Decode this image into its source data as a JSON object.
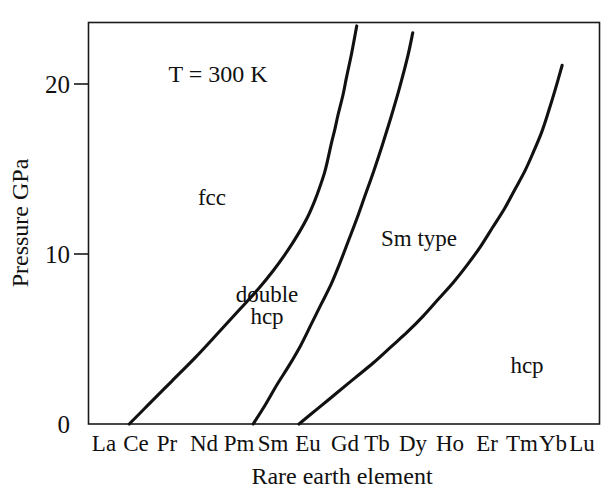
{
  "chart_data": {
    "type": "line",
    "title": "",
    "subtitle": "",
    "xlabel": "Rare earth element",
    "ylabel": "Pressure  GPa",
    "annotation": "T = 300 K",
    "grid": false,
    "legend_position": "none",
    "ylim": [
      0,
      23.5
    ],
    "yticks": [
      0,
      10,
      20
    ],
    "ytick_labels": [
      "0",
      "10",
      "20"
    ],
    "categories": [
      "La",
      "Ce",
      "Pr",
      "Nd",
      "Pm",
      "Sm",
      "Eu",
      "Gd",
      "Tb",
      "Dy",
      "Ho",
      "Er",
      "Tm",
      "Yb",
      "Lu"
    ],
    "x_index": [
      1,
      2,
      3,
      4,
      5,
      6,
      7,
      8,
      9,
      10,
      11,
      12,
      13,
      14,
      15
    ],
    "xlim": [
      0.55,
      15.6
    ],
    "series": [
      {
        "name": "fcc / double hcp boundary",
        "x": [
          1.75,
          2.3,
          3.0,
          3.7,
          4.4,
          5.0,
          5.55,
          6.0,
          6.4,
          6.75,
          7.0,
          7.2,
          7.35,
          7.5,
          7.6,
          7.7,
          7.8,
          7.9,
          8.05,
          8.15,
          8.3,
          8.45
        ],
        "y": [
          0.0,
          1.1,
          2.5,
          3.9,
          5.4,
          6.7,
          7.9,
          9.0,
          10.1,
          11.2,
          12.1,
          13.0,
          13.8,
          14.7,
          15.5,
          16.4,
          17.2,
          18.1,
          19.3,
          20.3,
          21.7,
          23.3
        ]
      },
      {
        "name": "double hcp / Sm type boundary",
        "x": [
          5.4,
          5.75,
          6.1,
          6.45,
          6.8,
          7.1,
          7.4,
          7.7,
          7.95,
          8.2,
          8.45,
          8.7,
          8.95,
          9.2,
          9.45,
          9.7,
          9.95,
          10.1
        ],
        "y": [
          0.0,
          1.1,
          2.3,
          3.4,
          4.6,
          5.8,
          7.0,
          8.2,
          9.4,
          10.7,
          12.0,
          13.4,
          14.8,
          16.3,
          17.9,
          19.6,
          21.5,
          22.9
        ]
      },
      {
        "name": "Sm type / hcp boundary",
        "x": [
          6.75,
          7.3,
          7.85,
          8.4,
          8.95,
          9.45,
          9.95,
          10.4,
          10.85,
          11.3,
          11.7,
          12.1,
          12.45,
          12.8,
          13.1,
          13.4,
          13.65,
          13.9,
          14.1,
          14.3,
          14.5
        ],
        "y": [
          0.0,
          0.9,
          1.8,
          2.7,
          3.6,
          4.5,
          5.4,
          6.3,
          7.3,
          8.3,
          9.3,
          10.4,
          11.5,
          12.6,
          13.7,
          14.8,
          15.9,
          17.1,
          18.3,
          19.6,
          21.0
        ]
      }
    ],
    "region_labels": [
      {
        "text": "fcc",
        "x": 3.35,
        "y": 14.0
      },
      {
        "text": "double",
        "x": 6.05,
        "y": 8.1
      },
      {
        "text": "hcp",
        "x": 6.05,
        "y": 6.8
      },
      {
        "text": "Sm type",
        "x": 10.1,
        "y": 10.6
      },
      {
        "text": "hcp",
        "x": 13.3,
        "y": 3.6
      }
    ]
  },
  "figure": {
    "annotation_text": "T = 300 K",
    "x_axis_title": "Rare earth element",
    "y_axis_title": "Pressure  GPa",
    "tick_0": "0",
    "tick_10": "10",
    "tick_20": "20",
    "label_la": "La",
    "label_ce": "Ce",
    "label_pr": "Pr",
    "label_nd": "Nd",
    "label_pm": "Pm",
    "label_sm": "Sm",
    "label_eu": "Eu",
    "label_gd": "Gd",
    "label_tb": "Tb",
    "label_dy": "Dy",
    "label_ho": "Ho",
    "label_er": "Er",
    "label_tm": "Tm",
    "label_yb": "Yb",
    "label_lu": "Lu",
    "region_fcc": "fcc",
    "region_double": "double",
    "region_double_hcp": "hcp",
    "region_sm_type": "Sm type",
    "region_hcp": "hcp",
    "colors": {
      "curve": "#111111",
      "frame": "#1a1a1a",
      "background": "#ffffff",
      "text": "#111111"
    }
  }
}
